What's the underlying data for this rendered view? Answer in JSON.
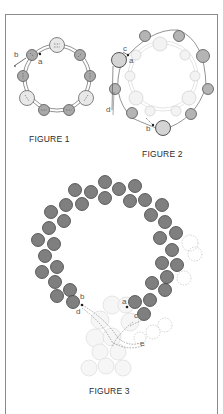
{
  "figures": [
    {
      "id": "figure-1",
      "caption": "FIGURE 1",
      "labels": {
        "a": "a",
        "b": "b"
      }
    },
    {
      "id": "figure-2",
      "caption": "FIGURE 2",
      "labels": {
        "a": "a",
        "b": "b",
        "c": "c",
        "d": "d"
      }
    },
    {
      "id": "figure-3",
      "caption": "FIGURE 3",
      "labels": {
        "a": "a",
        "b": "b",
        "c": "c",
        "d": "d",
        "e": "e"
      }
    }
  ],
  "colors": {
    "frame": "#8a8a8a",
    "bead_dark": "#7d7d7d",
    "bead_mid": "#bdbdbd",
    "bead_light": "#e6e6e6",
    "bead_ghost": "#f1f1f1",
    "thread": "#555555"
  }
}
